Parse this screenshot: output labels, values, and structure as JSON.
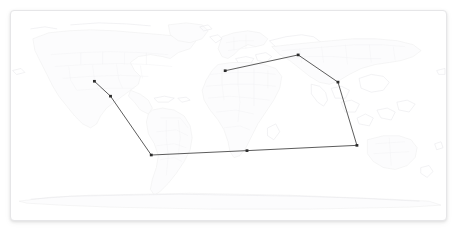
{
  "panel": {
    "name": "map-panel",
    "background_color": "#ffffff",
    "border_color": "#e6e6e8",
    "corner_radius_px": 4,
    "x": 10,
    "y": 10,
    "width": 437,
    "height": 211
  },
  "map": {
    "type": "world-basemap",
    "projection": "equirectangular",
    "land_stroke_color": "#e9e9ec",
    "land_fill_color": "#fcfcfd",
    "admin_boundary_color": "#f1f1f3",
    "ocean_color": "#ffffff",
    "labels": [],
    "attribution": ""
  },
  "route": {
    "name": "route-polyline",
    "line_color": "#4a4a4a",
    "line_width_px": 0.9,
    "marker_color": "#2b2b2b",
    "marker_size_px": 3,
    "marker_count": 8,
    "segment_count": 7,
    "closed": false,
    "points": [
      {
        "id": "p1",
        "x": 88,
        "y": 80,
        "label": ""
      },
      {
        "id": "p2",
        "x": 105,
        "y": 97,
        "label": ""
      },
      {
        "id": "p3",
        "x": 148,
        "y": 164,
        "label": ""
      },
      {
        "id": "p4",
        "x": 249,
        "y": 159,
        "label": ""
      },
      {
        "id": "p5",
        "x": 365,
        "y": 153,
        "label": ""
      },
      {
        "id": "p6",
        "x": 345,
        "y": 81,
        "label": ""
      },
      {
        "id": "p7",
        "x": 303,
        "y": 50,
        "label": ""
      },
      {
        "id": "p8",
        "x": 226,
        "y": 68,
        "label": ""
      }
    ]
  },
  "chart_data": {
    "type": "line",
    "title": "",
    "xlabel": "",
    "ylabel": "",
    "grid": false,
    "legend": "none",
    "x": [
      88,
      105,
      148,
      249,
      365,
      345,
      303,
      226
    ],
    "values": [
      80,
      97,
      164,
      159,
      153,
      81,
      50,
      68
    ],
    "series": [
      {
        "name": "route",
        "points": [
          [
            88,
            80
          ],
          [
            105,
            97
          ],
          [
            148,
            164
          ],
          [
            249,
            159
          ],
          [
            365,
            153
          ],
          [
            345,
            81
          ],
          [
            303,
            50
          ],
          [
            226,
            68
          ]
        ]
      }
    ],
    "xlim": [
      10,
      447
    ],
    "ylim": [
      10,
      221
    ]
  }
}
